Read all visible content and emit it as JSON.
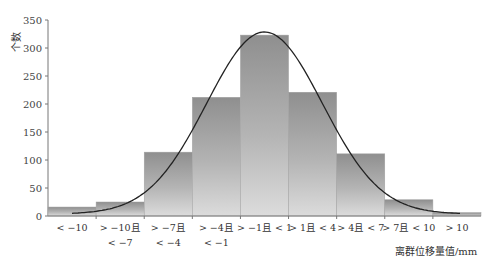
{
  "chart_data": {
    "type": "bar",
    "title": "",
    "xlabel": "离群位移量值/mm",
    "ylabel": "个数",
    "ylim": [
      0,
      350
    ],
    "yticks": [
      0,
      50,
      100,
      150,
      200,
      250,
      300,
      350
    ],
    "categories": [
      [
        "< −10"
      ],
      [
        "> −10且",
        "< −7"
      ],
      [
        "> −7且",
        "< −4"
      ],
      [
        "> −4且",
        "< −1"
      ],
      [
        "> −1且 < 1"
      ],
      [
        "> 1且 < 4"
      ],
      [
        "> 4且 < 7"
      ],
      [
        "> 7且 < 10"
      ],
      [
        "> 10"
      ]
    ],
    "values": [
      16,
      25,
      114,
      212,
      323,
      221,
      111,
      29,
      6
    ],
    "overlay": {
      "type": "line",
      "description": "fitted normal distribution curve",
      "approx_peak": 325
    },
    "grid": false,
    "legend": null,
    "bar_style": "grayscale gradient, no gaps"
  }
}
